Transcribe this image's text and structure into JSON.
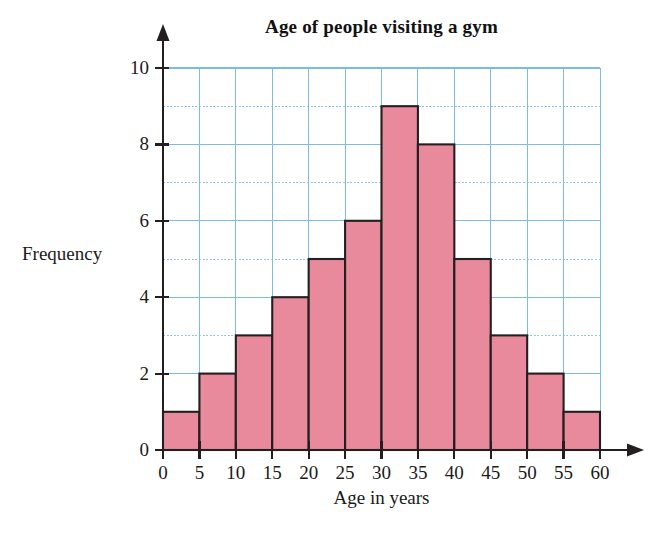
{
  "chart_data": {
    "type": "bar",
    "title": "Age of people visiting a gym",
    "xlabel": "Age in years",
    "ylabel": "Frequency",
    "categories": [
      "0-5",
      "5-10",
      "10-15",
      "15-20",
      "20-25",
      "25-30",
      "30-35",
      "35-40",
      "40-45",
      "45-50",
      "50-55",
      "55-60"
    ],
    "bin_edges": [
      0,
      5,
      10,
      15,
      20,
      25,
      30,
      35,
      40,
      45,
      50,
      55,
      60
    ],
    "values": [
      1,
      2,
      3,
      4,
      5,
      6,
      9,
      8,
      5,
      3,
      2,
      1
    ],
    "x_tick_labels": [
      "0",
      "5",
      "10",
      "15",
      "20",
      "25",
      "30",
      "35",
      "40",
      "45",
      "50",
      "55",
      "60"
    ],
    "y_tick_labels": [
      "0",
      "2",
      "4",
      "6",
      "8",
      "10"
    ],
    "y_tick_values": [
      0,
      2,
      4,
      6,
      8,
      10
    ],
    "xlim": [
      0,
      60
    ],
    "ylim": [
      0,
      10
    ],
    "grid": true,
    "grid_x_step": 5,
    "grid_y_step": 1,
    "legend": "none",
    "bar_fill_color": "#e88a9b",
    "bar_edge_color": "#231f20",
    "grid_color": "#7cbbe8",
    "axis_color": "#231f20",
    "background_color": "#ffffff"
  },
  "axes": {
    "y_arrow": "arrow-up",
    "x_arrow": "arrow-right"
  }
}
